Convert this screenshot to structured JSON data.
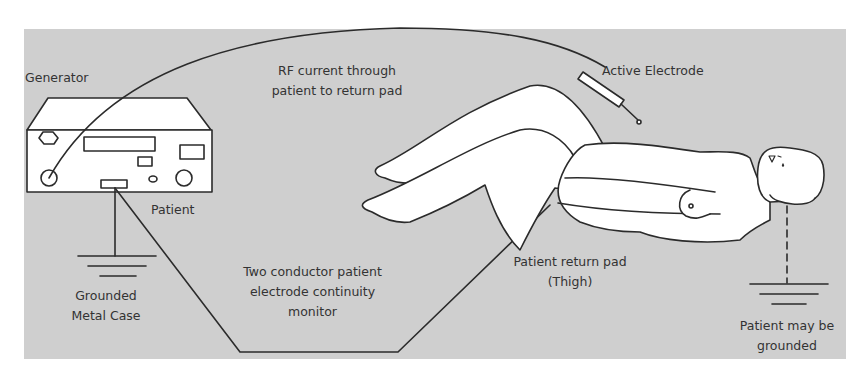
{
  "diagram": {
    "colors": {
      "background": "#cfcfcf",
      "line": "#2b2b2b",
      "fill": "#ffffff",
      "text": "#333333"
    },
    "labels": {
      "generator": "Generator",
      "rf_current_line1": "RF current through",
      "rf_current_line2": "patient to return pad",
      "active_electrode": "Active Electrode",
      "patient": "Patient",
      "grounded_case_line1": "Grounded",
      "grounded_case_line2": "Metal Case",
      "monitor_line1": "Two conductor patient",
      "monitor_line2": "electrode continuity",
      "monitor_line3": "monitor",
      "return_pad_line1": "Patient return pad",
      "return_pad_line2": "(Thigh)",
      "patient_grounded_line1": "Patient may be",
      "patient_grounded_line2": "grounded"
    },
    "nodes": [
      {
        "id": "generator",
        "label": "Generator"
      },
      {
        "id": "active-electrode",
        "label": "Active Electrode"
      },
      {
        "id": "patient",
        "label": "Patient"
      },
      {
        "id": "return-pad",
        "label": "Patient return pad (Thigh)"
      },
      {
        "id": "case-ground",
        "label": "Grounded Metal Case"
      },
      {
        "id": "patient-ground",
        "label": "Patient may be grounded"
      }
    ],
    "edges": [
      {
        "from": "generator",
        "to": "active-electrode",
        "label": "RF current through patient to return pad"
      },
      {
        "from": "generator",
        "to": "return-pad",
        "label": "Two conductor patient electrode continuity monitor"
      },
      {
        "from": "generator",
        "to": "case-ground",
        "label": "Grounded Metal Case"
      },
      {
        "from": "patient",
        "to": "patient-ground",
        "label": "Patient may be grounded",
        "style": "dashed"
      }
    ]
  }
}
